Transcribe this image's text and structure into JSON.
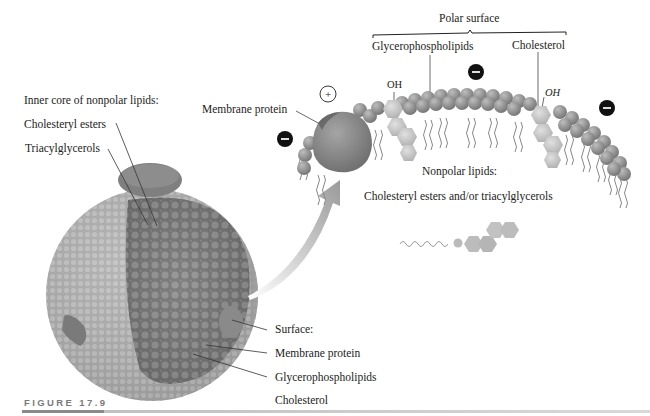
{
  "figure": {
    "caption": "FIGURE 17.9"
  },
  "left_panel": {
    "core_heading": "Inner core of nonpolar lipids:",
    "core_items": [
      "Cholesteryl esters",
      "Triacylglycerols"
    ],
    "surface_heading": "Surface:",
    "surface_items": [
      "Membrane protein",
      "Glycerophospholipids",
      "Cholesterol"
    ]
  },
  "right_panel": {
    "polar_surface_label": "Polar surface",
    "glycerophospholipids_label": "Glycerophospholipids",
    "cholesterol_label": "Cholesterol",
    "membrane_protein_label": "Membrane protein",
    "oh_label_1": "OH",
    "oh_label_2": "OH",
    "charge_positive": "+",
    "charge_negative": "−",
    "nonpolar_heading": "Nonpolar lipids:",
    "nonpolar_items": "Cholesteryl esters and/or triacylglycerols"
  },
  "colors": {
    "sphere_surface": "#a9a9a9",
    "core": "#7d7d7d",
    "protein": "#8c8c8c",
    "phospholipid_head": "#8f8f8f",
    "cholesterol": "#c8c8c8",
    "charge": "#111111"
  }
}
